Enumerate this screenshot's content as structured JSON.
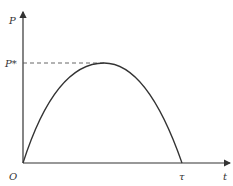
{
  "diagram": {
    "y_axis_label": "P",
    "x_axis_label": "t",
    "origin_label": "O",
    "peak_label": "P*",
    "end_label": "τ",
    "curve": {
      "shape": "asymmetric-hump",
      "start": "O",
      "peak": "P*",
      "end": "τ"
    },
    "colors": {
      "line": "#333333",
      "dashed": "#555555",
      "background": "#ffffff"
    }
  }
}
